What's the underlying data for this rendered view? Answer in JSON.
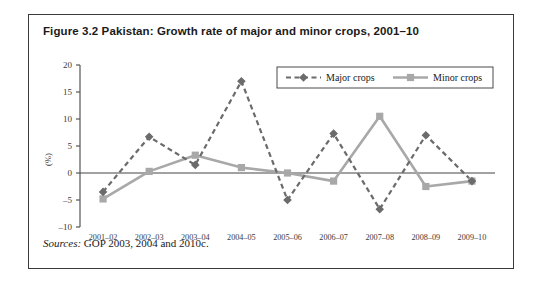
{
  "figure": {
    "title": "Figure 3.2 Pakistan: Growth rate of major and minor crops, 2001–10",
    "source_label": "Sources:",
    "source_text": " GOP 2003, 2004 and 2010c."
  },
  "colors": {
    "major_crops": "#6b6b6b",
    "minor_crops": "#a8a8a8",
    "axis": "#555555",
    "frame": "#3a3a3a",
    "text": "#1a1a1a"
  },
  "chart_data": {
    "type": "line",
    "title": "Figure 3.2 Pakistan: Growth rate of major and minor crops, 2001–10",
    "xlabel": "",
    "ylabel": "(%)",
    "categories": [
      "2001–02",
      "2002–03",
      "2003–04",
      "2004–05",
      "2005–06",
      "2006–07",
      "2007–08",
      "2008–09",
      "2009–10"
    ],
    "yticks": [
      -10,
      -5,
      0,
      5,
      10,
      15,
      20
    ],
    "ytick_labels": [
      "–10",
      "–5",
      "0",
      "5",
      "10",
      "15",
      "20"
    ],
    "ylim": [
      -10,
      20
    ],
    "grid": false,
    "legend_position": "top-right",
    "series": [
      {
        "name": "Major crops",
        "style": "dashed",
        "marker": "diamond",
        "color": "#6b6b6b",
        "values": [
          -3.5,
          6.7,
          1.5,
          17.0,
          -5.0,
          7.3,
          -6.7,
          7.0,
          -1.5
        ]
      },
      {
        "name": "Minor crops",
        "style": "solid",
        "marker": "square",
        "color": "#a8a8a8",
        "values": [
          -4.8,
          0.3,
          3.3,
          1.0,
          0.0,
          -1.5,
          10.5,
          -2.5,
          -1.5
        ]
      }
    ]
  }
}
